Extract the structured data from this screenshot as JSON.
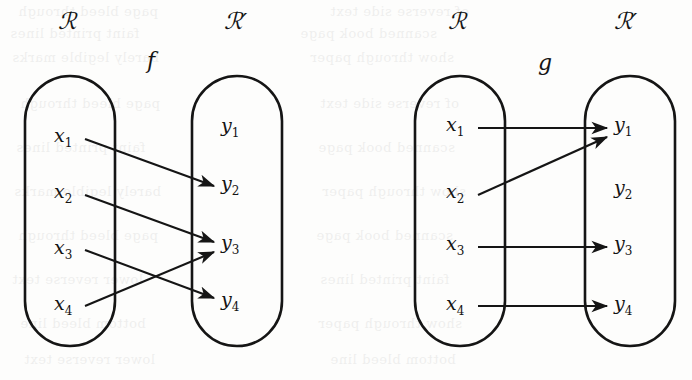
{
  "figure": {
    "background_color": "#fdfdfc",
    "ink_color": "#151515",
    "panels": [
      {
        "id": "panel-f",
        "function_label": "f",
        "domain_label": "ℛ",
        "codomain_label": "ℛ′",
        "domain_elements": [
          {
            "id": "x1",
            "base": "x",
            "sub": "1"
          },
          {
            "id": "x2",
            "base": "x",
            "sub": "2"
          },
          {
            "id": "x3",
            "base": "x",
            "sub": "3"
          },
          {
            "id": "x4",
            "base": "x",
            "sub": "4"
          }
        ],
        "codomain_elements": [
          {
            "id": "y1",
            "base": "y",
            "sub": "1"
          },
          {
            "id": "y2",
            "base": "y",
            "sub": "2"
          },
          {
            "id": "y3",
            "base": "y",
            "sub": "3"
          },
          {
            "id": "y4",
            "base": "y",
            "sub": "4"
          }
        ],
        "mappings": [
          {
            "from": "x1",
            "to": "y2"
          },
          {
            "from": "x2",
            "to": "y3"
          },
          {
            "from": "x3",
            "to": "y4"
          },
          {
            "from": "x4",
            "to": "y3"
          }
        ],
        "unmapped_codomain": [
          "y1"
        ]
      },
      {
        "id": "panel-g",
        "function_label": "g",
        "domain_label": "ℛ",
        "codomain_label": "ℛ′",
        "domain_elements": [
          {
            "id": "x1",
            "base": "x",
            "sub": "1"
          },
          {
            "id": "x2",
            "base": "x",
            "sub": "2"
          },
          {
            "id": "x3",
            "base": "x",
            "sub": "3"
          },
          {
            "id": "x4",
            "base": "x",
            "sub": "4"
          }
        ],
        "codomain_elements": [
          {
            "id": "y1",
            "base": "y",
            "sub": "1"
          },
          {
            "id": "y2",
            "base": "y",
            "sub": "2"
          },
          {
            "id": "y3",
            "base": "y",
            "sub": "3"
          },
          {
            "id": "y4",
            "base": "y",
            "sub": "4"
          }
        ],
        "mappings": [
          {
            "from": "x1",
            "to": "y1"
          },
          {
            "from": "x2",
            "to": "y1"
          },
          {
            "from": "x3",
            "to": "y3"
          },
          {
            "from": "x4",
            "to": "y4"
          }
        ],
        "unmapped_codomain": [
          "y2"
        ]
      }
    ]
  },
  "labels": {
    "panel_f": {
      "set_left": "ℛ",
      "set_right": "ℛ′",
      "fn": "f",
      "x1": "x",
      "x1s": "1",
      "x2": "x",
      "x2s": "2",
      "x3": "x",
      "x3s": "3",
      "x4": "x",
      "x4s": "4",
      "y1": "y",
      "y1s": "1",
      "y2": "y",
      "y2s": "2",
      "y3": "y",
      "y3s": "3",
      "y4": "y",
      "y4s": "4"
    },
    "panel_g": {
      "set_left": "ℛ",
      "set_right": "ℛ′",
      "fn": "g",
      "x1": "x",
      "x1s": "1",
      "x2": "x",
      "x2s": "2",
      "x3": "x",
      "x3s": "3",
      "x4": "x",
      "x4s": "4",
      "y1": "y",
      "y1s": "1",
      "y2": "y",
      "y2s": "2",
      "y3": "y",
      "y3s": "3",
      "y4": "y",
      "y4s": "4"
    }
  },
  "bleed_text": {
    "l1": "page bleed through",
    "l2": "of reverse side text",
    "l3": "faint printed lines",
    "l4": "scanned book page",
    "l5": "barely legible marks",
    "l6": "show through paper",
    "l7": "lower reverse text",
    "l8": "bottom bleed line"
  }
}
